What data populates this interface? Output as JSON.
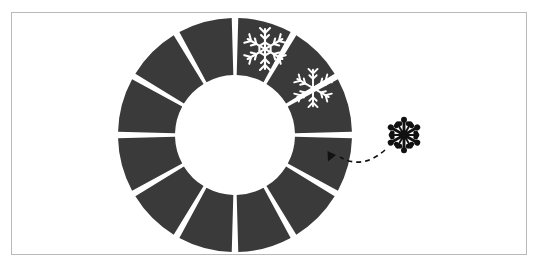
{
  "figure": {
    "background_color": "#ffffff",
    "frame": {
      "x": 11,
      "y": 12,
      "width": 516,
      "height": 243,
      "border_color": "#b9b9b9",
      "border_width": 1
    }
  },
  "ring": {
    "name": "segmented-ring",
    "center_x": 235,
    "center_y": 135,
    "outer_radius": 117,
    "inner_radius": 60,
    "segment_count": 12,
    "segment_color": "#3a3a3a",
    "gap_color": "#ffffff",
    "gap_degrees": 3.2,
    "start_angle_degrees": -90,
    "segments": [
      {
        "index": 0,
        "position": "12-1 o'clock",
        "filled": true,
        "icon": "snowflake-icon",
        "icon_color": "#ffffff"
      },
      {
        "index": 1,
        "position": "1-2 o'clock",
        "filled": true,
        "icon": "snowflake-icon",
        "icon_color": "#ffffff"
      },
      {
        "index": 2,
        "position": "2-3 o'clock",
        "filled": true,
        "icon": null,
        "icon_color": null
      },
      {
        "index": 3,
        "position": "3-4 o'clock",
        "filled": true,
        "icon": null,
        "icon_color": null
      },
      {
        "index": 4,
        "position": "4-5 o'clock",
        "filled": true,
        "icon": null,
        "icon_color": null
      },
      {
        "index": 5,
        "position": "5-6 o'clock",
        "filled": true,
        "icon": null,
        "icon_color": null
      },
      {
        "index": 6,
        "position": "6-7 o'clock",
        "filled": true,
        "icon": null,
        "icon_color": null
      },
      {
        "index": 7,
        "position": "7-8 o'clock",
        "filled": true,
        "icon": null,
        "icon_color": null
      },
      {
        "index": 8,
        "position": "8-9 o'clock",
        "filled": true,
        "icon": null,
        "icon_color": null
      },
      {
        "index": 9,
        "position": "9-10 o'clock",
        "filled": true,
        "icon": null,
        "icon_color": null
      },
      {
        "index": 10,
        "position": "10-11 o'clock",
        "filled": true,
        "icon": null,
        "icon_color": null
      },
      {
        "index": 11,
        "position": "11-12 o'clock",
        "filled": true,
        "icon": null,
        "icon_color": null
      }
    ]
  },
  "ring_icons": [
    {
      "name": "snowflake-icon-segment-0",
      "x": 265,
      "y": 49,
      "size": 44,
      "color": "#ffffff",
      "style": "outlined-hex-center"
    },
    {
      "name": "snowflake-icon-segment-1",
      "x": 313,
      "y": 88,
      "size": 40,
      "color": "#ffffff",
      "style": "outlined-plain-center"
    }
  ],
  "loose_icon": {
    "name": "snowflake-icon-detached",
    "x": 404,
    "y": 135,
    "size": 36,
    "color": "#111111",
    "style": "solid-ornate"
  },
  "arrow": {
    "name": "dashed-drag-arrow",
    "color": "#111111",
    "dash_pattern": "5,4",
    "stroke_width": 1.6,
    "start_x": 385,
    "start_y": 150,
    "control_x": 362,
    "control_y": 170,
    "end_x": 340,
    "end_y": 157,
    "arrowhead_x": 336,
    "arrowhead_y": 155,
    "arrowhead_size": 9,
    "direction": "points-into-ring-segment-2"
  }
}
